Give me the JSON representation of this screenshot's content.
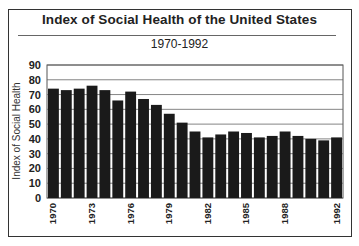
{
  "title": "Index of Social Health of the United States",
  "subtitle": "1970-1992",
  "chart_data": {
    "type": "bar",
    "title": "Index of Social Health of the United States",
    "subtitle": "1970-1992",
    "xlabel": "",
    "ylabel": "Index of Social Health",
    "ylim": [
      0,
      90
    ],
    "yticks": [
      0,
      10,
      20,
      30,
      40,
      50,
      60,
      70,
      80,
      90
    ],
    "grid": true,
    "legend": null,
    "categories": [
      "1970",
      "1971",
      "1972",
      "1973",
      "1974",
      "1975",
      "1976",
      "1977",
      "1978",
      "1979",
      "1980",
      "1981",
      "1982",
      "1983",
      "1984",
      "1985",
      "1986",
      "1987",
      "1988",
      "1989",
      "1990",
      "1991",
      "1992"
    ],
    "xtick_labels": [
      "1970",
      "1973",
      "1976",
      "1979",
      "1982",
      "1985",
      "1988",
      "1992"
    ],
    "values": [
      74,
      73,
      74,
      76,
      73,
      66,
      72,
      67,
      63,
      57,
      51,
      45,
      41,
      43,
      45,
      44,
      41,
      42,
      45,
      42,
      40,
      39,
      41
    ],
    "bar_color": "#1a1a1a"
  }
}
